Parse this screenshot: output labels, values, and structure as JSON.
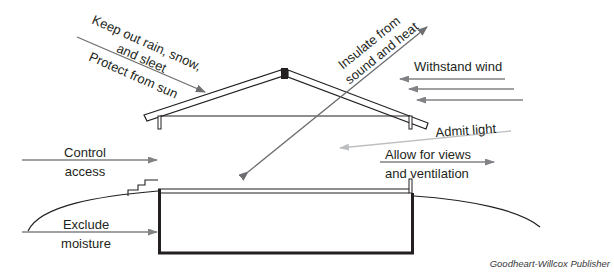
{
  "diagram": {
    "labels": {
      "keep_out_line1": "Keep out rain, snow,",
      "keep_out_line2": "and sleet",
      "protect_sun": "Protect from sun",
      "insulate_line1": "Insulate from",
      "insulate_line2": "sound and heat",
      "withstand_wind": "Withstand wind",
      "admit_light": "Admit light",
      "allow_views_line1": "Allow for views",
      "allow_views_line2": "and ventilation",
      "control_line1": "Control",
      "control_line2": "access",
      "exclude_line1": "Exclude",
      "exclude_line2": "moisture"
    },
    "credit": "Goodheart-Willcox Publisher",
    "colors": {
      "structure": "#231f20",
      "arrow_dark": "#6d6e71",
      "arrow_medium": "#808285",
      "arrow_light": "#bcbec0"
    }
  }
}
